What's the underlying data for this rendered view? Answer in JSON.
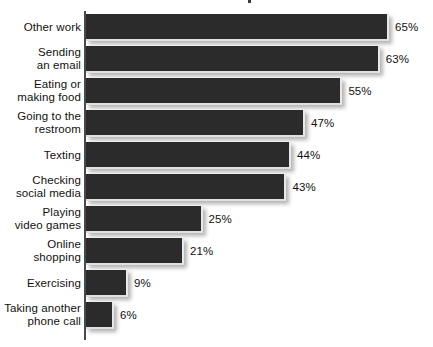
{
  "chart_data": {
    "type": "bar",
    "orientation": "horizontal",
    "title": "",
    "xlabel": "",
    "ylabel": "",
    "xlim": [
      0,
      65
    ],
    "grid": false,
    "legend": null,
    "value_suffix": "%",
    "categories": [
      "Other work",
      "Sending\nan email",
      "Eating or\nmaking food",
      "Going to the\nrestroom",
      "Texting",
      "Checking\nsocial media",
      "Playing\nvideo games",
      "Online\nshopping",
      "Exercising",
      "Taking another\nphone call"
    ],
    "values": [
      65,
      63,
      55,
      47,
      44,
      43,
      25,
      21,
      9,
      6
    ],
    "value_labels": [
      "65%",
      "63%",
      "55%",
      "47%",
      "44%",
      "43%",
      "25%",
      "21%",
      "9%",
      "6%"
    ],
    "colors": {
      "bar": "#2b2b2b",
      "background": "#ffffff",
      "axis": "#4a4a4a",
      "text": "#111111"
    }
  }
}
